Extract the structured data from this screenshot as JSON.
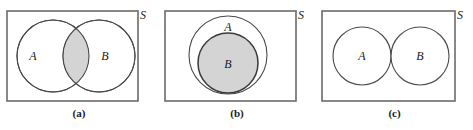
{
  "figure": {
    "type": "venn-diagram-set",
    "background": "#ffffff",
    "stroke_color": "#3a3a3a",
    "rect_stroke_color": "#6b6b6b",
    "shade_color": "#d4d4d4",
    "text_color": "#1a1a1a",
    "panels": [
      {
        "id": "a",
        "caption": "(a)",
        "universe_label": "S",
        "set_labels": [
          "A",
          "B"
        ],
        "relation": "intersecting",
        "shaded_region": "A-intersect-B",
        "rect": {
          "x": 7,
          "y": 11,
          "width": 131,
          "height": 90
        },
        "circles": [
          {
            "label": "A",
            "cx": 53,
            "cy": 56,
            "r": 36,
            "label_x": 33,
            "label_y": 60
          },
          {
            "label": "B",
            "cx": 99,
            "cy": 56,
            "r": 36,
            "label_x": 103,
            "label_y": 60
          }
        ],
        "universe_label_x": 143,
        "universe_label_y": 18
      },
      {
        "id": "b",
        "caption": "(b)",
        "universe_label": "S",
        "set_labels": [
          "A",
          "B"
        ],
        "relation": "subset",
        "shaded_region": "B",
        "rect": {
          "x": 165,
          "y": 11,
          "width": 131,
          "height": 90
        },
        "circles": [
          {
            "label": "A",
            "cx": 228,
            "cy": 55,
            "r": 39,
            "label_x": 228,
            "label_y": 30
          },
          {
            "label": "B",
            "cx": 228,
            "cy": 63,
            "r": 30,
            "label_x": 228,
            "label_y": 68
          }
        ],
        "universe_label_x": 301,
        "universe_label_y": 18
      },
      {
        "id": "c",
        "caption": "(c)",
        "universe_label": "S",
        "set_labels": [
          "A",
          "B"
        ],
        "relation": "disjoint",
        "shaded_region": "none",
        "rect": {
          "x": 322,
          "y": 11,
          "width": 133,
          "height": 90
        },
        "circles": [
          {
            "label": "A",
            "cx": 362,
            "cy": 56,
            "r": 29,
            "label_x": 362,
            "label_y": 60
          },
          {
            "label": "B",
            "cx": 420,
            "cy": 56,
            "r": 29,
            "label_x": 420,
            "label_y": 60
          }
        ],
        "universe_label_x": 460,
        "universe_label_y": 18
      }
    ]
  }
}
